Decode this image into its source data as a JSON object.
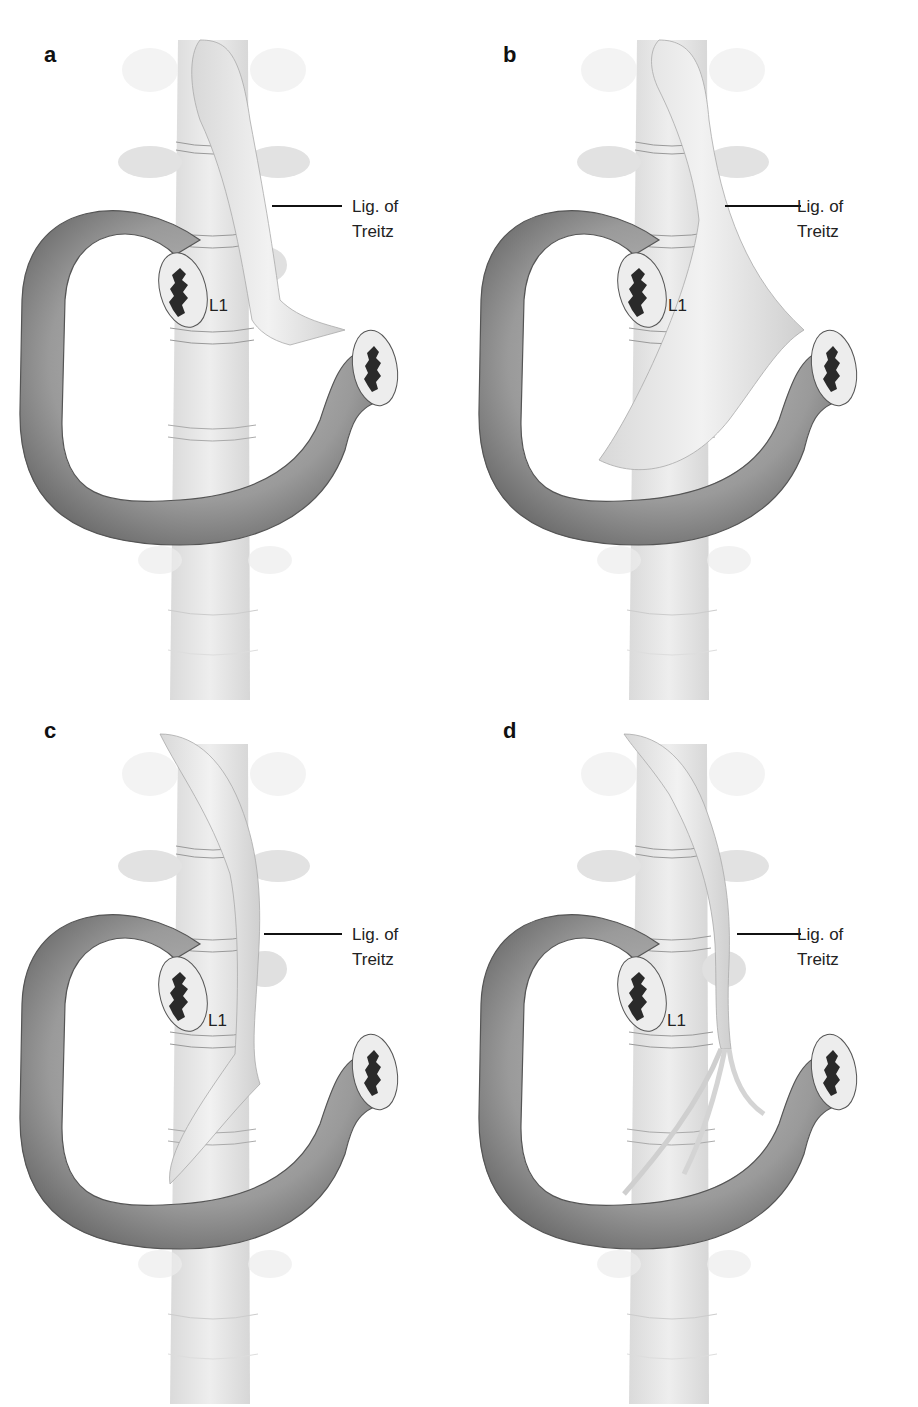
{
  "figure": {
    "panels": [
      {
        "id": "a",
        "letter": "a",
        "variant": "thin-fan",
        "ligament_label_line1": "Lig. of",
        "ligament_label_line2": "Treitz",
        "vertebra_label": "L1"
      },
      {
        "id": "b",
        "letter": "b",
        "variant": "broad-fan",
        "ligament_label_line1": "Lig. of",
        "ligament_label_line2": "Treitz",
        "vertebra_label": "L1"
      },
      {
        "id": "c",
        "letter": "c",
        "variant": "narrow-to-flexure",
        "ligament_label_line1": "Lig. of",
        "ligament_label_line2": "Treitz",
        "vertebra_label": "L1"
      },
      {
        "id": "d",
        "letter": "d",
        "variant": "split-bands",
        "ligament_label_line1": "Lig. of",
        "ligament_label_line2": "Treitz",
        "vertebra_label": "L1"
      }
    ],
    "colors": {
      "duodenum": "#9a9a9a",
      "duodenum_edge": "#555555",
      "spine": "#e4e4e4",
      "ligament": "#ececec",
      "lumen": "#2a2a2a",
      "text": "#222222"
    }
  }
}
